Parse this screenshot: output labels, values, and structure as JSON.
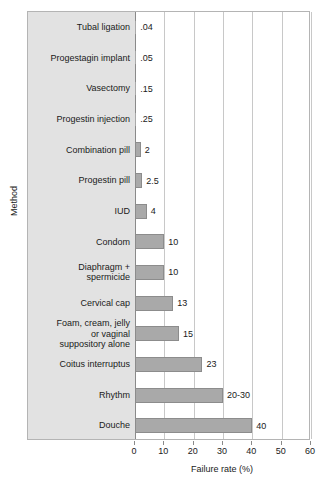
{
  "chart_data": {
    "type": "bar",
    "orientation": "horizontal",
    "title": "",
    "xlabel": "Failure rate (%)",
    "ylabel": "Method",
    "xlim": [
      0,
      60
    ],
    "ylim": null,
    "grid": true,
    "legend": null,
    "xticks": [
      0,
      10,
      20,
      30,
      40,
      50,
      60
    ],
    "xtick_labels": [
      "0",
      "10",
      "20",
      "30",
      "40",
      "50",
      "60"
    ],
    "categories": [
      "Tubal ligation",
      "Progestagin implant",
      "Vasectomy",
      "Progestin injection",
      "Combination pill",
      "Progestin pill",
      "IUD",
      "Condom",
      "Diaphragm + spermicide",
      "Cervical cap",
      "Foam, cream, jelly or vaginal suppository alone",
      "Coitus interruptus",
      "Rhythm",
      "Douche"
    ],
    "values": [
      0.04,
      0.05,
      0.15,
      0.25,
      2,
      2.5,
      4,
      10,
      10,
      13,
      15,
      23,
      30,
      40
    ],
    "data_labels": [
      ".04",
      ".05",
      ".15",
      ".25",
      "2",
      "2.5",
      "4",
      "10",
      "10",
      "13",
      "15",
      "23",
      "20-30",
      "40"
    ],
    "bars": [
      {
        "label": "Tubal ligation",
        "label_lines": [
          "Tubal ligation"
        ],
        "value": 0.04,
        "display": ".04"
      },
      {
        "label": "Progestagin implant",
        "label_lines": [
          "Progestagin implant"
        ],
        "value": 0.05,
        "display": ".05"
      },
      {
        "label": "Vasectomy",
        "label_lines": [
          "Vasectomy"
        ],
        "value": 0.15,
        "display": ".15"
      },
      {
        "label": "Progestin injection",
        "label_lines": [
          "Progestin injection"
        ],
        "value": 0.25,
        "display": ".25"
      },
      {
        "label": "Combination pill",
        "label_lines": [
          "Combination pill"
        ],
        "value": 2,
        "display": "2"
      },
      {
        "label": "Progestin pill",
        "label_lines": [
          "Progestin pill"
        ],
        "value": 2.5,
        "display": "2.5"
      },
      {
        "label": "IUD",
        "label_lines": [
          "IUD"
        ],
        "value": 4,
        "display": "4"
      },
      {
        "label": "Condom",
        "label_lines": [
          "Condom"
        ],
        "value": 10,
        "display": "10"
      },
      {
        "label": "Diaphragm + spermicide",
        "label_lines": [
          "Diaphragm +",
          "spermicide"
        ],
        "value": 10,
        "display": "10"
      },
      {
        "label": "Cervical cap",
        "label_lines": [
          "Cervical cap"
        ],
        "value": 13,
        "display": "13"
      },
      {
        "label": "Foam, cream, jelly or vaginal suppository alone",
        "label_lines": [
          "Foam, cream, jelly",
          "or vaginal",
          "suppository alone"
        ],
        "value": 15,
        "display": "15"
      },
      {
        "label": "Coitus interruptus",
        "label_lines": [
          "Coitus interruptus"
        ],
        "value": 23,
        "display": "23"
      },
      {
        "label": "Rhythm",
        "label_lines": [
          "Rhythm"
        ],
        "value": 30,
        "display": "20-30"
      },
      {
        "label": "Douche",
        "label_lines": [
          "Douche"
        ],
        "value": 40,
        "display": "40"
      }
    ],
    "colors": {
      "bar_fill": "#a9a9a9",
      "bar_edge": "#8c8c8c",
      "label_gutter": "#e2e2e2",
      "gridline": "#c8c8c8",
      "frame": "#b4b4b4",
      "text": "#1a1a1a",
      "background": "#ffffff"
    }
  }
}
